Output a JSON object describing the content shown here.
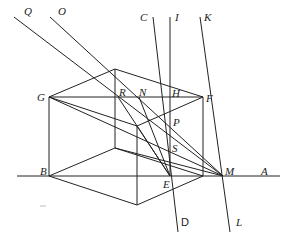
{
  "diagram": {
    "stroke_color": "#222222",
    "labels": {
      "Q": "Q",
      "O": "O",
      "C": "C",
      "I": "I",
      "K": "K",
      "G": "G",
      "R": "R",
      "N": "N",
      "H": "H",
      "F": "F",
      "P": "P",
      "S": "S",
      "B": "B",
      "E": "E",
      "M": "M",
      "A": "A",
      "D": "D",
      "L": "L"
    },
    "points": {
      "Q": [
        14,
        17
      ],
      "O": [
        50,
        17
      ],
      "C": [
        153,
        17
      ],
      "I": [
        170,
        17
      ],
      "K": [
        200,
        17
      ],
      "G": [
        49,
        97
      ],
      "R": [
        118,
        97
      ],
      "N": [
        139,
        97
      ],
      "H": [
        170,
        97
      ],
      "F": [
        203,
        97
      ],
      "P": [
        170,
        120
      ],
      "S": [
        170,
        148
      ],
      "B": [
        49,
        176
      ],
      "E": [
        170,
        176
      ],
      "M": [
        223,
        176
      ],
      "A": [
        280,
        176
      ],
      "D": [
        178,
        232
      ],
      "L": [
        230,
        232
      ]
    }
  }
}
